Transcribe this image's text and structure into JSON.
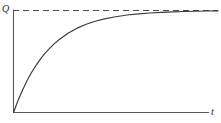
{
  "figure": {
    "kind": "line-plot",
    "background_color": "#ffffff",
    "ink_color": "#3a3a3a",
    "axis_color": "#5a5a5a",
    "width_px": 221,
    "height_px": 123
  },
  "labels": {
    "y_axis": "Q",
    "x_axis": "t"
  },
  "chart_data": {
    "type": "line",
    "title": "",
    "subtitle": "",
    "xlabel": "t",
    "ylabel": "Q",
    "grid": false,
    "legend_position": "none",
    "xlim": [
      0,
      9
    ],
    "ylim": [
      0,
      1.08
    ],
    "axis_ticks": {
      "x": [],
      "y": []
    },
    "annotations": [
      {
        "name": "asymptote",
        "style": "dashed",
        "orientation": "horizontal",
        "y": 1.0,
        "label": ""
      }
    ],
    "series": [
      {
        "name": "Q(t)",
        "style": "solid",
        "equation": "Q = Qmax * (1 - exp(-t / tau))",
        "tau": 1.6,
        "x": [
          0,
          0.2,
          0.4,
          0.6,
          0.8,
          1.0,
          1.2,
          1.4,
          1.6,
          1.8,
          2.0,
          2.4,
          2.8,
          3.2,
          3.6,
          4.0,
          4.5,
          5.0,
          5.5,
          6.0,
          6.5,
          7.0,
          7.5,
          8.0,
          8.5,
          9.0
        ],
        "y": [
          0.0,
          0.117,
          0.221,
          0.313,
          0.394,
          0.465,
          0.528,
          0.584,
          0.632,
          0.675,
          0.713,
          0.777,
          0.827,
          0.865,
          0.895,
          0.918,
          0.939,
          0.956,
          0.967,
          0.976,
          0.982,
          0.987,
          0.99,
          0.993,
          0.995,
          0.996
        ]
      }
    ]
  }
}
